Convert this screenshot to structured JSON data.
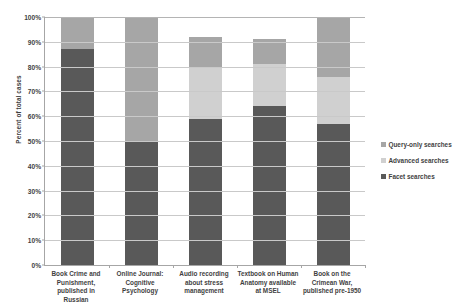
{
  "chart_data": {
    "type": "bar",
    "subtype": "stacked-bar-100",
    "title": "",
    "xlabel": "",
    "ylabel": "Percent of total cases",
    "ylim": [
      0,
      100
    ],
    "ytick_labels": [
      "100%",
      "90%",
      "80%",
      "70%",
      "60%",
      "50%",
      "40%",
      "30%",
      "20%",
      "10%",
      "0%"
    ],
    "ytick_values": [
      100,
      90,
      80,
      70,
      60,
      50,
      40,
      30,
      20,
      10,
      0
    ],
    "grid": true,
    "legend_position": "right",
    "categories": [
      "Book Crime and Punishment, published in Russian",
      "Online Journal: Cognitive Psychology",
      "Audio recording about stress management",
      "Textbook on Human Anatomy available at MSEL",
      "Book on the Crimean War, published pre-1950"
    ],
    "category_lines": [
      [
        "Book Crime and",
        "Punishment,",
        "published in Russian"
      ],
      [
        "Online Journal:",
        "Cognitive",
        "Psychology"
      ],
      [
        "Audio recording",
        "about stress",
        "management"
      ],
      [
        "Textbook on Human",
        "Anatomy available",
        "at MSEL"
      ],
      [
        "Book on the",
        "Crimean War,",
        "published pre-1950"
      ]
    ],
    "series": [
      {
        "name": "Facet searches",
        "color": "#595959",
        "values": [
          87,
          50,
          59,
          64,
          57
        ]
      },
      {
        "name": "Advanced searches",
        "color": "#d0d0d0",
        "values": [
          0,
          0,
          21,
          17,
          19
        ]
      },
      {
        "name": "Query-only searches",
        "color": "#a6a6a6",
        "values": [
          13,
          50,
          12,
          10,
          24
        ]
      }
    ],
    "series_totals": [
      100,
      100,
      92,
      91,
      100
    ]
  },
  "legend": {
    "items": [
      {
        "label": "Query-only searches",
        "color": "#a6a6a6"
      },
      {
        "label": "Advanced searches",
        "color": "#d0d0d0"
      },
      {
        "label": "Facet searches",
        "color": "#595959"
      }
    ]
  }
}
